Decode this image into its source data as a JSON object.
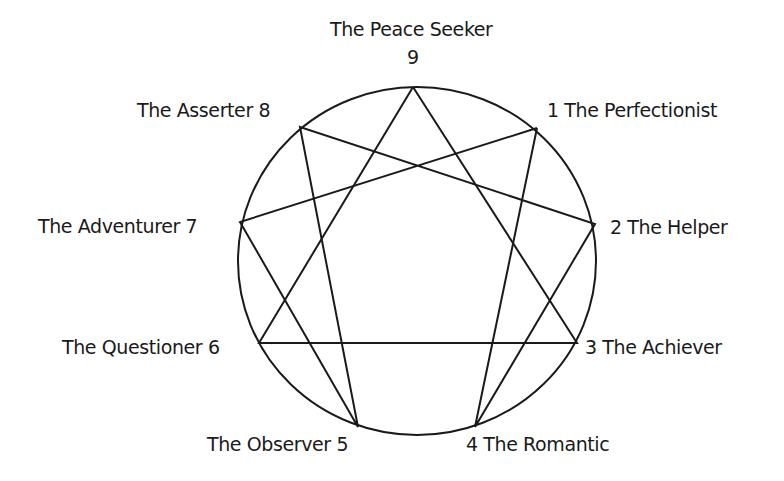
{
  "colors": {
    "stroke": "#1a1a1a",
    "background": "#ffffff"
  },
  "circle": {
    "cx": 417,
    "cy": 261,
    "rx": 179,
    "ry": 174
  },
  "points": [
    {
      "num": "1",
      "name": "The Perfectionist",
      "x": 537,
      "y": 128
    },
    {
      "num": "2",
      "name": "The Helper",
      "x": 595,
      "y": 224
    },
    {
      "num": "3",
      "name": "The Achiever",
      "x": 577,
      "y": 343
    },
    {
      "num": "4",
      "name": "The Romantic",
      "x": 475,
      "y": 427
    },
    {
      "num": "5",
      "name": "The Observer",
      "x": 358,
      "y": 427
    },
    {
      "num": "6",
      "name": "The Questioner",
      "x": 259,
      "y": 343
    },
    {
      "num": "7",
      "name": "The Adventurer",
      "x": 240,
      "y": 222
    },
    {
      "num": "8",
      "name": "The Asserter",
      "x": 300,
      "y": 127
    },
    {
      "num": "9",
      "name": "The Peace Seeker",
      "x": 413,
      "y": 87
    }
  ],
  "hexad_sequence": [
    "1",
    "4",
    "2",
    "8",
    "5",
    "7",
    "1"
  ],
  "triangle_sequence": [
    "9",
    "3",
    "6",
    "9"
  ],
  "labels": {
    "p9_name": "The Peace Seeker",
    "p9_num": "9",
    "p8": "The Asserter  8",
    "p1": "1  The Perfectionist",
    "p7": "The Adventurer  7",
    "p2": "2  The Helper",
    "p6": "The Questioner  6",
    "p3": "3  The Achiever",
    "p5": "The Observer  5",
    "p4": "4  The Romantic"
  }
}
